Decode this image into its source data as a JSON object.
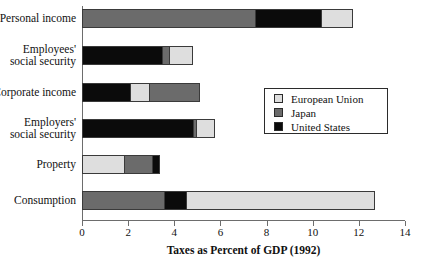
{
  "chart_data": {
    "type": "bar",
    "orientation": "horizontal",
    "stacked": true,
    "title": "",
    "xlabel": "Taxes as Percent of GDP (1992)",
    "ylabel": "",
    "xlim": [
      0,
      14
    ],
    "xticks": [
      0,
      2,
      4,
      6,
      8,
      10,
      12,
      14
    ],
    "xtick_labels": [
      "0",
      "2",
      "4",
      "6",
      "8",
      "10",
      "12",
      "14"
    ],
    "grid": false,
    "legend_position": "center-right",
    "categories": [
      "Personal income",
      "Employees'\nsocial security",
      "Corporate income",
      "Employers'\nsocial security",
      "Property",
      "Consumption"
    ],
    "series": [
      {
        "name": "European Union",
        "color": "#dedede",
        "values": [
          1.4,
          1.05,
          0.8,
          0.8,
          1.8,
          8.2
        ]
      },
      {
        "name": "Japan",
        "color": "#6b6b6b",
        "values": [
          7.5,
          0.3,
          2.2,
          0.15,
          1.25,
          3.55
        ]
      },
      {
        "name": "United States",
        "color": "#0b0b0b",
        "values": [
          2.85,
          3.45,
          2.1,
          4.8,
          0.35,
          0.95
        ]
      }
    ],
    "stack_order": [
      [
        "Japan",
        "United States",
        "European Union"
      ],
      [
        "United States",
        "Japan",
        "European Union"
      ],
      [
        "United States",
        "European Union",
        "Japan"
      ],
      [
        "United States",
        "Japan",
        "European Union"
      ],
      [
        "European Union",
        "Japan",
        "United States"
      ],
      [
        "Japan",
        "United States",
        "European Union"
      ]
    ],
    "totals": [
      11.75,
      4.8,
      5.1,
      5.75,
      3.4,
      12.7
    ]
  },
  "legend": {
    "items": [
      {
        "label": "European Union",
        "key": "eu"
      },
      {
        "label": "Japan",
        "key": "jp"
      },
      {
        "label": "United States",
        "key": "us"
      }
    ]
  },
  "axis": {
    "x_title": "Taxes as Percent of GDP (1992)",
    "tick_labels": [
      "0",
      "2",
      "4",
      "6",
      "8",
      "10",
      "12",
      "14"
    ]
  },
  "categories": {
    "labels": [
      "Personal income",
      "Employees'\nsocial security",
      "Corporate income",
      "Employers'\nsocial security",
      "Property",
      "Consumption"
    ]
  },
  "footer": {
    "scrap_text": ""
  }
}
